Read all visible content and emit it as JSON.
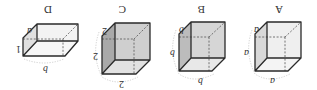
{
  "figure": {
    "orientation": "rotated 180 degrees",
    "options": [
      {
        "letter": "A",
        "shape": "cube",
        "edge_labels": [
          "a",
          "a",
          "a"
        ],
        "colors": {
          "front": "#efefef",
          "side": "#d9d9d9",
          "bottom": "#f4f4f4"
        }
      },
      {
        "letter": "B",
        "shape": "cube",
        "edge_labels": [
          "b",
          "b",
          "b"
        ],
        "colors": {
          "front": "#d6d6d6",
          "side": "#bcbcbc",
          "bottom": "#e8e8e8"
        }
      },
      {
        "letter": "C",
        "shape": "cube",
        "edge_labels": [
          "2",
          "2",
          "2"
        ],
        "colors": {
          "front": "#cfcfcf",
          "side": "#a9a9a9",
          "bottom": "#e2e2e2"
        }
      },
      {
        "letter": "D",
        "shape": "rectangular prism",
        "edge_labels": [
          "a",
          "1",
          "b"
        ],
        "colors": {
          "front": "#f3f3f3",
          "side": "#e0e0e0",
          "bottom": "#f7f7f7"
        }
      }
    ]
  }
}
